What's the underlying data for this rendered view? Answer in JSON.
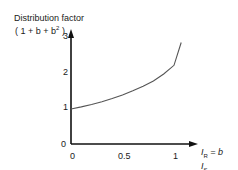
{
  "chart_data": {
    "type": "line",
    "title": "",
    "ylabel": "Distribution factor",
    "ylabel_formula": "(1 + b + b²)",
    "xlabel": "I_R / I_S = b",
    "x_ticks": [
      "0",
      "0.5",
      "1"
    ],
    "y_ticks": [
      "0",
      "1",
      "2",
      "3"
    ],
    "xlim": [
      0,
      1.07
    ],
    "ylim": [
      0,
      3
    ],
    "grid": false,
    "legend": null,
    "series": [
      {
        "name": "1 + b + b²",
        "x": [
          0,
          0.1,
          0.2,
          0.3,
          0.4,
          0.5,
          0.6,
          0.7,
          0.8,
          0.9,
          1.0,
          1.07
        ],
        "y": [
          1.0,
          1.06,
          1.13,
          1.21,
          1.3,
          1.4,
          1.52,
          1.65,
          1.8,
          2.0,
          2.25,
          2.9
        ]
      }
    ],
    "color": "#555555"
  },
  "labels": {
    "y_title": "Distribution factor",
    "y_formula_prefix": "( 1 + b + b",
    "y_formula_sup": "2",
    "y_formula_suffix": " )",
    "x_name_I": "I",
    "x_name_R": "R",
    "x_name_eq": " =  b",
    "x_name_I2": "I",
    "x_name_S": "S"
  }
}
